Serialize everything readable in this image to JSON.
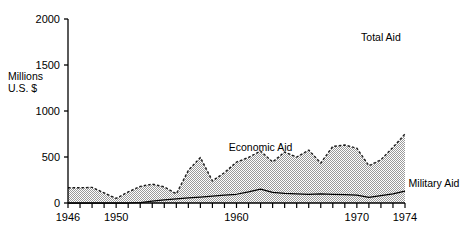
{
  "chart_data": {
    "type": "area",
    "title": "",
    "xlabel": "",
    "ylabel": "Millions U.S. $",
    "ylabel_line1": "Millions",
    "ylabel_line2": "U.S. $",
    "xlim": [
      1946,
      1974
    ],
    "ylim": [
      0,
      2000
    ],
    "grid": false,
    "legend_position": "inline-annotations",
    "stacked": true,
    "y_ticks": [
      0,
      500,
      1000,
      1500,
      2000
    ],
    "y_tick_labels": [
      "0",
      "500",
      "1000",
      "1500",
      "2000"
    ],
    "x_ticks": [
      1946,
      1947,
      1948,
      1949,
      1950,
      1951,
      1952,
      1953,
      1954,
      1955,
      1956,
      1957,
      1958,
      1959,
      1960,
      1961,
      1962,
      1963,
      1964,
      1965,
      1966,
      1967,
      1968,
      1969,
      1970,
      1971,
      1972,
      1973,
      1974
    ],
    "x_tick_labels_shown": [
      "1946",
      "1950",
      "1960",
      "1970",
      "1974"
    ],
    "x_tick_label_years": [
      1946,
      1950,
      1960,
      1970,
      1974
    ],
    "x": [
      1946,
      1947,
      1948,
      1949,
      1950,
      1951,
      1952,
      1953,
      1954,
      1955,
      1956,
      1957,
      1958,
      1959,
      1960,
      1961,
      1962,
      1963,
      1964,
      1965,
      1966,
      1967,
      1968,
      1969,
      1970,
      1971,
      1972,
      1973,
      1974
    ],
    "series": [
      {
        "name": "Military Aid",
        "color": "#000000",
        "style": "solid-line",
        "values": [
          0,
          0,
          0,
          0,
          0,
          0,
          5,
          20,
          35,
          45,
          55,
          65,
          75,
          85,
          95,
          120,
          150,
          115,
          105,
          100,
          95,
          100,
          95,
          90,
          85,
          60,
          80,
          100,
          130
        ]
      },
      {
        "name": "Economic Aid",
        "color": "#b8b8b8",
        "style": "stipple-fill-dashed-edge",
        "values": [
          165,
          165,
          170,
          110,
          50,
          120,
          175,
          185,
          140,
          55,
          300,
          430,
          165,
          245,
          350,
          375,
          415,
          330,
          450,
          400,
          480,
          335,
          520,
          540,
          510,
          345,
          390,
          505,
          620
        ]
      }
    ],
    "total_series": {
      "name": "Total Aid",
      "values": [
        165,
        165,
        170,
        110,
        50,
        120,
        180,
        205,
        175,
        100,
        355,
        495,
        240,
        330,
        445,
        495,
        565,
        445,
        555,
        500,
        575,
        435,
        615,
        630,
        595,
        405,
        470,
        605,
        750
      ]
    },
    "annotations": [
      {
        "text": "Total Aid",
        "x": 1972,
        "y": 1760
      },
      {
        "text": "Economic Aid",
        "x": 1962,
        "y": 560
      },
      {
        "text": "Military Aid",
        "x": 1974.3,
        "y": 175
      }
    ]
  }
}
